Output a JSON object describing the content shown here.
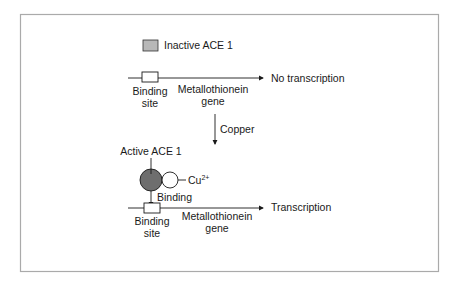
{
  "legend": {
    "label": "Inactive ACE 1",
    "swatch_color": "#b8b8b8"
  },
  "top": {
    "binding_site_line1": "Binding",
    "binding_site_line2": "site",
    "gene_line1": "Metallothionein",
    "gene_line2": "gene",
    "outcome": "No transcription"
  },
  "middle": {
    "arrow_label": "Copper"
  },
  "bottom": {
    "active_label": "Active ACE 1",
    "ion_label": "Cu",
    "ion_charge": "2+",
    "binding_label": "Binding",
    "binding_site_line1": "Binding",
    "binding_site_line2": "site",
    "gene_line1": "Metallothionein",
    "gene_line2": "gene",
    "outcome": "Transcription",
    "active_color": "#6e6e6e"
  }
}
